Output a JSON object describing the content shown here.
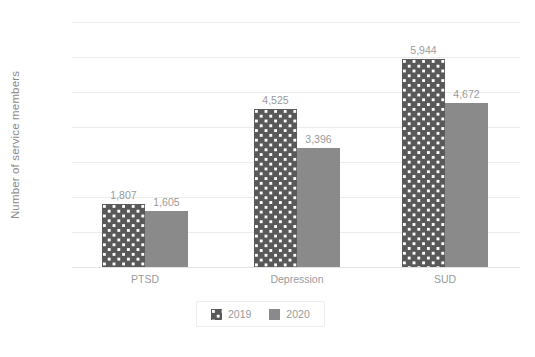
{
  "chart_data": {
    "type": "bar",
    "title": "",
    "xlabel": "",
    "ylabel": "Number of service members",
    "categories": [
      "PTSD",
      "Depression",
      "SUD"
    ],
    "series": [
      {
        "name": "2019",
        "values": [
          1807,
          4525,
          5944
        ],
        "color": "#595959",
        "pattern": "white-dots"
      },
      {
        "name": "2020",
        "values": [
          1605,
          3396,
          4672
        ],
        "color": "#8a8a8a",
        "pattern": "solid"
      }
    ],
    "value_labels": [
      [
        "1,807",
        "4,525",
        "5,944"
      ],
      [
        "1,605",
        "3,396",
        "4,672"
      ]
    ],
    "ylim": [
      0,
      7000
    ],
    "yticks": [
      0,
      1000,
      2000,
      3000,
      4000,
      5000,
      6000,
      7000
    ],
    "ytick_labels": [
      "0",
      "1,000",
      "2,000",
      "3,000",
      "4,000",
      "5,000",
      "6,000",
      "7,000"
    ],
    "grid": "horizontal",
    "legend_position": "bottom",
    "legend_entries": [
      "2019",
      "2020"
    ],
    "background_color": "#ffffff",
    "gridline_color": "#ebebeb",
    "text_color": "#9a9a9a"
  }
}
